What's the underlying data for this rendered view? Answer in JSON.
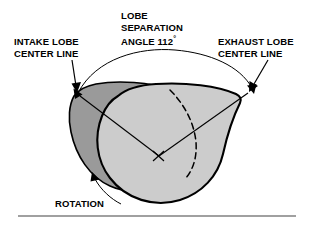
{
  "diagram": {
    "labels": {
      "intake_line1": "INTAKE LOBE",
      "intake_line2": "CENTER LINE",
      "exhaust_line1": "EXHAUST LOBE",
      "exhaust_line2": "CENTER LINE",
      "angle_line1": "LOBE",
      "angle_line2": "SEPARATION",
      "angle_line3": "ANGLE 112",
      "angle_degree_symbol": "°",
      "rotation": "ROTATION"
    },
    "measurement": {
      "name": "lobe separation angle",
      "value": 112,
      "unit": "degrees",
      "display": "112°"
    },
    "colors": {
      "intake_lobe_fill": "#9a9a9a",
      "exhaust_lobe_fill": "#cccccc",
      "outline": "#000000",
      "background": "#ffffff",
      "text": "#000000",
      "rule": "#808080"
    },
    "parts": [
      {
        "name": "intake-lobe",
        "shade": "dark gray",
        "position": "rear left"
      },
      {
        "name": "exhaust-lobe",
        "shade": "light gray",
        "position": "front right"
      },
      {
        "name": "center-mark",
        "symbol": "×"
      },
      {
        "name": "hidden-edge",
        "style": "dashed"
      }
    ]
  }
}
